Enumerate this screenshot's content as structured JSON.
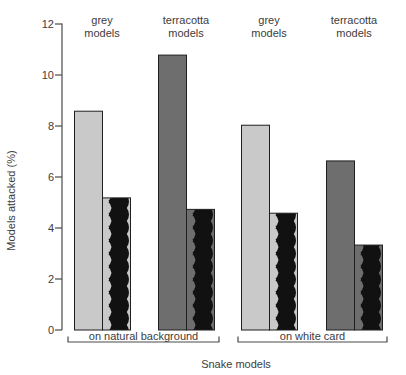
{
  "chart_data": {
    "type": "bar",
    "title": "",
    "ylabel": "Models attacked (%)",
    "xlabel": "Snake models",
    "ylim": [
      0,
      12
    ],
    "yticks": [
      0,
      2,
      4,
      6,
      8,
      10,
      12
    ],
    "grid": false,
    "legend": "none",
    "bar_styles": {
      "plain": "solid fill",
      "zigzag": "black vertical zigzag ribbon over bar-colored background"
    },
    "colors": {
      "grey": "#c9c9c9",
      "terracotta": "#6e6e6e",
      "zigzag_black": "#111111",
      "bar_border": "#1f1f1f",
      "axis": "#4a4a4a",
      "text": "#3c3c3c"
    },
    "groups": [
      {
        "label": "on natural background",
        "columns": [
          {
            "label": "grey models",
            "color_key": "grey",
            "bars": [
              {
                "style": "plain",
                "value": 8.6
              },
              {
                "style": "zigzag",
                "value": 5.2
              }
            ]
          },
          {
            "label": "terracotta models",
            "color_key": "terracotta",
            "bars": [
              {
                "style": "plain",
                "value": 10.8
              },
              {
                "style": "zigzag",
                "value": 4.75
              }
            ]
          }
        ]
      },
      {
        "label": "on white card",
        "columns": [
          {
            "label": "grey models",
            "color_key": "grey",
            "bars": [
              {
                "style": "plain",
                "value": 8.05
              },
              {
                "style": "zigzag",
                "value": 4.6
              }
            ]
          },
          {
            "label": "terracotta models",
            "color_key": "terracotta",
            "bars": [
              {
                "style": "plain",
                "value": 6.65
              },
              {
                "style": "zigzag",
                "value": 3.35
              }
            ]
          }
        ]
      }
    ]
  }
}
